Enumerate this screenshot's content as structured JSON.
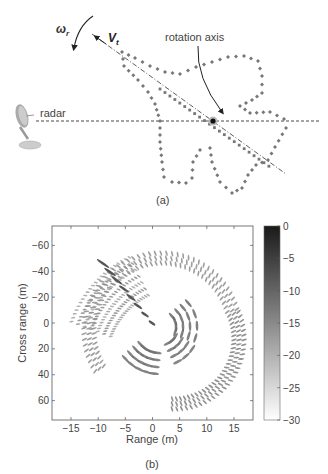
{
  "panel_a": {
    "label": "(a)",
    "radar_label": "radar",
    "rotation_axis_label": "rotation axis",
    "omega_symbol": "ω",
    "omega_subscript": "r",
    "velocity_symbol": "V",
    "velocity_subscript": "t",
    "icons": [
      "radar-dish-icon",
      "rotation-arrow-icon",
      "velocity-arrow-icon"
    ]
  },
  "panel_b": {
    "label": "(b)"
  },
  "chart_data": {
    "type": "heatmap",
    "title": "",
    "xlabel": "Range (m)",
    "ylabel": "Cross range (m)",
    "xlim": [
      -18.5,
      18.5
    ],
    "ylim": [
      -75,
      75
    ],
    "y_inverted": true,
    "x_ticks": [
      -15,
      -10,
      -5,
      0,
      5,
      10,
      15
    ],
    "x_tick_labels": [
      "−15",
      "−10",
      "−5",
      "0",
      "5",
      "10",
      "15"
    ],
    "y_ticks": [
      -60,
      -40,
      -20,
      0,
      20,
      40,
      60
    ],
    "y_tick_labels": [
      "−60",
      "−40",
      "−20",
      "0",
      "20",
      "40",
      "60"
    ],
    "grid": false,
    "colorbar": {
      "min": -30,
      "max": 0,
      "ticks": [
        0,
        -5,
        -10,
        -15,
        -20,
        -25,
        -30
      ],
      "tick_labels": [
        "0",
        "−5",
        "−10",
        "−15",
        "−20",
        "−25",
        "−30"
      ],
      "colormap": "gray (dark=0 dB, white=-30 dB)"
    }
  }
}
